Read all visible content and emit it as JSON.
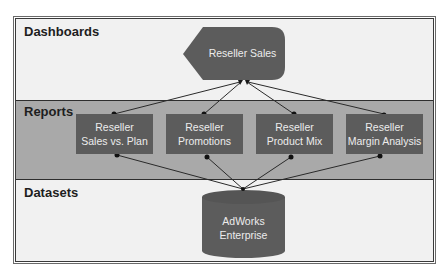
{
  "layers": {
    "dashboards": {
      "label": "Dashboards"
    },
    "reports": {
      "label": "Reports"
    },
    "datasets": {
      "label": "Datasets"
    }
  },
  "dashboard": {
    "label": "Reseller Sales"
  },
  "reports": [
    {
      "line1": "Reseller",
      "line2": "Sales vs. Plan"
    },
    {
      "line1": "Reseller",
      "line2": "Promotions"
    },
    {
      "line1": "Reseller",
      "line2": "Product Mix"
    },
    {
      "line1": "Reseller",
      "line2": "Margin Analysis"
    }
  ],
  "dataset": {
    "line1": "AdWorks",
    "line2": "Enterprise"
  },
  "colors": {
    "shape_fill": "#5c5c5c",
    "reports_band": "#a9a9a9",
    "light_band": "#f1f1f1",
    "connector": "#2a2a2a"
  }
}
